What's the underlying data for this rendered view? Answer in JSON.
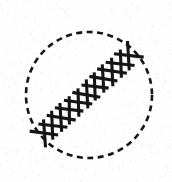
{
  "figure": {
    "title": "Dashed circle with diagonal cross-stitch seam",
    "canvas": {
      "width": 172,
      "height": 182,
      "background_color": "#fefefe",
      "speckle_color": "#e6e6e6",
      "ink_color": "#151515"
    },
    "circle": {
      "name": "dashed-circle",
      "center_x": 89,
      "center_y": 95,
      "radius": 63,
      "stroke_color": "#151515",
      "stroke_width": 2.6,
      "dash_length": 6,
      "dash_gap": 4.5,
      "fill": "none"
    },
    "seam": {
      "name": "cross-stitch-seam",
      "start_x": 40,
      "start_y": 137,
      "end_x": 133,
      "end_y": 52,
      "stitch_count": 11,
      "stroke_color": "#151515",
      "stroke_width": 3.1,
      "half_width": 11,
      "overhang": 3.5,
      "angle_degrees": -42
    },
    "speckle": {
      "count": 620,
      "min_size": 0.7,
      "max_size": 2.1,
      "opacity": 0.55
    }
  }
}
